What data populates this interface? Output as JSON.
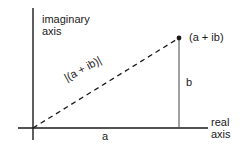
{
  "figure": {
    "background_color": "#ffffff",
    "stroke_color": "#1a1a1a",
    "labels": {
      "imaginary_axis_line1": "imaginary",
      "imaginary_axis_line2": "axis",
      "real_axis_line1": "real",
      "real_axis_line2": "axis",
      "point": "(a + ib)",
      "modulus": "|(a + ib)|",
      "horizontal_leg": "a",
      "vertical_leg": "b"
    },
    "geometry": {
      "origin": {
        "x": 33,
        "y": 128
      },
      "point": {
        "x": 179,
        "y": 38
      },
      "vertical_axis": {
        "x": 33,
        "y_top": 8,
        "y_bottom": 140
      },
      "horizontal_axis": {
        "y": 128,
        "x_left": 18,
        "x_right": 208
      },
      "drop_line": {
        "x": 179,
        "y_top": 38,
        "y_bottom": 128
      },
      "dash_pattern": "5 4"
    }
  }
}
